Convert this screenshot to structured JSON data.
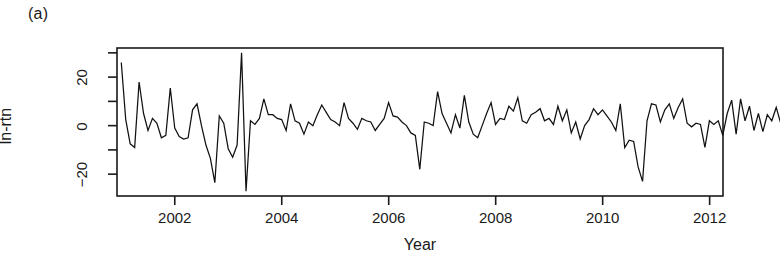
{
  "figure": {
    "panel_label": "(a)",
    "background_color": "#ffffff",
    "line_color": "#111111",
    "axis_color": "#1a1a1a"
  },
  "chart_data": {
    "type": "line",
    "title": "",
    "subtitle": "",
    "panel": "(a)",
    "xlabel": "Year",
    "ylabel": "ln-rtn",
    "xlim": [
      2000.92,
      2012.25
    ],
    "ylim": [
      -29,
      32
    ],
    "xticks": [
      2002,
      2004,
      2006,
      2008,
      2010,
      2012
    ],
    "xtick_labels": [
      "2002",
      "2004",
      "2006",
      "2008",
      "2010",
      "2012"
    ],
    "yticks": [
      -20,
      0,
      20
    ],
    "ytick_labels": [
      "-20",
      "0",
      "20"
    ],
    "yticks_minor": [
      -30,
      -10,
      10,
      30
    ],
    "grid": false,
    "legend": null,
    "frequency": "monthly",
    "series": [
      {
        "name": "ln-rtn",
        "x_start": 2001.0,
        "x_step": 0.0833,
        "values": [
          26.0,
          2.5,
          -7.5,
          -9.0,
          18.0,
          5.0,
          -2.0,
          3.0,
          1.0,
          -5.0,
          -4.0,
          15.5,
          -1.0,
          -4.5,
          -5.5,
          -5.0,
          6.5,
          9.0,
          0.0,
          -8.0,
          -13.5,
          -23.5,
          4.0,
          1.0,
          -9.5,
          -13.0,
          -8.0,
          30.0,
          -27.0,
          2.0,
          0.5,
          3.0,
          11.0,
          4.5,
          4.5,
          3.0,
          2.5,
          -2.0,
          9.0,
          2.0,
          1.0,
          -3.5,
          1.5,
          0.0,
          4.5,
          8.5,
          5.5,
          2.5,
          1.5,
          0.0,
          9.5,
          3.0,
          1.0,
          -1.5,
          3.0,
          2.0,
          1.5,
          -2.0,
          0.5,
          3.0,
          9.5,
          4.0,
          3.5,
          1.5,
          0.0,
          -3.0,
          -4.0,
          -18.0,
          1.5,
          1.0,
          0.0,
          14.0,
          5.0,
          1.0,
          -3.0,
          4.5,
          -1.0,
          12.5,
          1.5,
          -3.5,
          -5.0,
          0.0,
          5.0,
          9.5,
          0.5,
          3.0,
          2.5,
          8.0,
          6.0,
          11.5,
          2.0,
          1.0,
          4.5,
          5.5,
          7.0,
          2.0,
          3.0,
          0.5,
          8.0,
          2.0,
          6.5,
          -3.0,
          1.5,
          -5.5,
          0.0,
          2.5,
          7.0,
          4.5,
          6.5,
          4.0,
          1.5,
          -2.0,
          9.0,
          -9.0,
          -6.0,
          -6.5,
          -17.0,
          -23.0,
          2.0,
          9.0,
          8.5,
          1.5,
          6.5,
          9.0,
          3.0,
          7.5,
          11.0,
          1.0,
          -0.5,
          1.0,
          0.5,
          -9.0,
          2.0,
          0.5,
          2.0,
          -4.0,
          5.0,
          10.5,
          -3.5,
          11.0,
          2.0,
          8.0,
          -2.0,
          5.0,
          -2.5,
          4.5,
          2.0,
          7.5,
          1.0,
          -5.5,
          0.5,
          6.0,
          -3.0,
          1.0
        ]
      }
    ]
  }
}
